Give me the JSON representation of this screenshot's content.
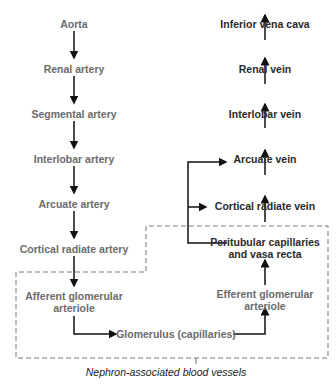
{
  "arterial": [
    {
      "id": "aorta",
      "label": "Aorta"
    },
    {
      "id": "renal-artery",
      "label": "Renal artery"
    },
    {
      "id": "segmental-artery",
      "label": "Segmental artery"
    },
    {
      "id": "interlobar-artery",
      "label": "Interlobar artery"
    },
    {
      "id": "arcuate-artery",
      "label": "Arcuate artery"
    },
    {
      "id": "cortical-radiate-artery",
      "label": "Cortical radiate artery"
    }
  ],
  "nephron": {
    "afferent": [
      "Afferent glomerular",
      "arteriole"
    ],
    "glomerulus": "Glomerulus (capillaries)",
    "efferent": [
      "Efferent glomerular",
      "arteriole"
    ],
    "peritubular": [
      "Peritubular capillaries",
      "and vasa recta"
    ],
    "caption": "Nephron-associated blood vessels"
  },
  "venous": [
    {
      "id": "cortical-radiate-vein",
      "label": "Cortical radiate vein"
    },
    {
      "id": "arcuate-vein",
      "label": "Arcuate vein"
    },
    {
      "id": "interlobar-vein",
      "label": "Interlobar vein"
    },
    {
      "id": "renal-vein",
      "label": "Renal vein"
    },
    {
      "id": "inferior-vena-cava",
      "label": "Inferior vena cava"
    }
  ]
}
